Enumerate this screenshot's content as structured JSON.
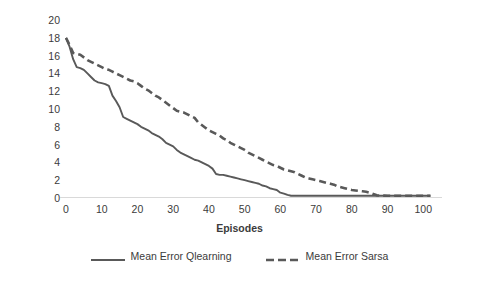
{
  "chart_data": {
    "type": "line",
    "title": "",
    "xlabel": "Episodes",
    "ylabel": "Mean Error per episode",
    "xlim": [
      0,
      103
    ],
    "ylim": [
      0,
      20
    ],
    "grid": false,
    "legend_position": "bottom",
    "x_ticks": [
      0,
      10,
      20,
      30,
      40,
      50,
      60,
      70,
      80,
      90,
      100
    ],
    "y_ticks": [
      0,
      2,
      4,
      6,
      8,
      10,
      12,
      14,
      16,
      18,
      20
    ],
    "line_color": "#595959",
    "axis_color": "#d9d9d9",
    "text_color": "#3b3b3b",
    "x": [
      0,
      1,
      2,
      3,
      4,
      5,
      6,
      7,
      8,
      9,
      10,
      11,
      12,
      13,
      14,
      15,
      16,
      17,
      18,
      19,
      20,
      21,
      22,
      23,
      24,
      25,
      26,
      27,
      28,
      29,
      30,
      31,
      32,
      33,
      34,
      35,
      36,
      37,
      38,
      39,
      40,
      41,
      42,
      43,
      44,
      45,
      46,
      47,
      48,
      49,
      50,
      51,
      52,
      53,
      54,
      55,
      56,
      57,
      58,
      59,
      60,
      61,
      62,
      63,
      64,
      65,
      66,
      67,
      68,
      69,
      70,
      71,
      72,
      73,
      74,
      75,
      76,
      77,
      78,
      79,
      80,
      81,
      82,
      83,
      84,
      85,
      86,
      87,
      88,
      89,
      90,
      91,
      92,
      93,
      94,
      95,
      96,
      97,
      98,
      99,
      100,
      101,
      102
    ],
    "series": [
      {
        "name": "Mean Error Qlearning",
        "style": "solid",
        "color": "#595959",
        "values": [
          18.0,
          17.0,
          15.6,
          14.7,
          14.6,
          14.4,
          14.0,
          13.6,
          13.2,
          13.0,
          12.9,
          12.8,
          12.6,
          11.5,
          10.9,
          10.2,
          9.1,
          8.9,
          8.7,
          8.5,
          8.3,
          8.0,
          7.8,
          7.6,
          7.3,
          7.1,
          6.9,
          6.6,
          6.2,
          6.0,
          5.8,
          5.4,
          5.1,
          4.9,
          4.7,
          4.5,
          4.3,
          4.2,
          4.0,
          3.8,
          3.6,
          3.3,
          2.7,
          2.6,
          2.6,
          2.5,
          2.4,
          2.3,
          2.2,
          2.1,
          2.0,
          1.9,
          1.8,
          1.7,
          1.6,
          1.4,
          1.3,
          1.1,
          1.0,
          0.9,
          0.6,
          0.5,
          0.35,
          0.25,
          0.25,
          0.25,
          0.25,
          0.25,
          0.25,
          0.25,
          0.25,
          0.25,
          0.25,
          0.25,
          0.25,
          0.25,
          0.25,
          0.25,
          0.25,
          0.25,
          0.25,
          0.25,
          0.25,
          0.25,
          0.25,
          0.25,
          0.25,
          0.25,
          0.25,
          0.25,
          0.25,
          0.25,
          0.25,
          0.25,
          0.25,
          0.25,
          0.25,
          0.25,
          0.25,
          0.25,
          0.25,
          0.25,
          0.25
        ]
      },
      {
        "name": "Mean Error Sarsa",
        "style": "dashed",
        "color": "#595959",
        "values": [
          18.0,
          17.2,
          16.3,
          16.2,
          16.1,
          15.8,
          15.5,
          15.3,
          15.1,
          14.9,
          14.7,
          14.5,
          14.4,
          14.2,
          14.0,
          13.8,
          13.6,
          13.4,
          13.2,
          13.1,
          12.9,
          12.6,
          12.3,
          12.1,
          11.8,
          11.5,
          11.3,
          11.0,
          10.7,
          10.4,
          10.1,
          9.8,
          9.7,
          9.6,
          9.4,
          9.2,
          9.0,
          8.5,
          8.2,
          7.9,
          7.6,
          7.4,
          7.2,
          7.0,
          6.7,
          6.5,
          6.2,
          6.0,
          5.8,
          5.6,
          5.4,
          5.1,
          4.9,
          4.7,
          4.5,
          4.3,
          4.1,
          3.9,
          3.7,
          3.6,
          3.4,
          3.2,
          3.1,
          3.0,
          2.9,
          2.7,
          2.5,
          2.3,
          2.2,
          2.1,
          2.0,
          1.9,
          1.8,
          1.7,
          1.6,
          1.5,
          1.3,
          1.2,
          1.1,
          1.0,
          0.9,
          0.85,
          0.8,
          0.75,
          0.7,
          0.6,
          0.45,
          0.3,
          0.28,
          0.27,
          0.26,
          0.25,
          0.25,
          0.25,
          0.25,
          0.25,
          0.25,
          0.25,
          0.25,
          0.25,
          0.25,
          0.25,
          0.25
        ]
      }
    ]
  },
  "axes": {
    "y_title": "Mean Error per episode",
    "x_title": "Episodes"
  },
  "legend": {
    "entries": [
      {
        "label": "Mean Error Qlearning",
        "style": "solid"
      },
      {
        "label": "Mean Error Sarsa",
        "style": "dashed"
      }
    ]
  }
}
